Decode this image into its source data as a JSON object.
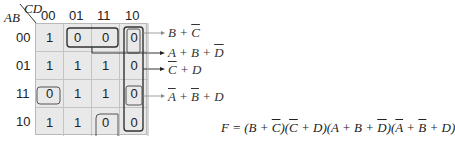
{
  "kmap": {
    "row_var": "AB",
    "col_var": "CD",
    "col_labels": [
      "00",
      "01",
      "11",
      "10"
    ],
    "row_labels": [
      "00",
      "01",
      "11",
      "10"
    ],
    "cells": [
      [
        "1",
        "0",
        "0",
        "0"
      ],
      [
        "1",
        "1",
        "1",
        "0"
      ],
      [
        "0",
        "1",
        "1",
        "0"
      ],
      [
        "1",
        "1",
        "0",
        "0"
      ]
    ]
  },
  "groups": [
    {
      "label_parts": [
        {
          "t": "B + "
        },
        {
          "t": "C",
          "ov": true
        }
      ],
      "text": "B+C̅"
    },
    {
      "label_parts": [
        {
          "t": "A + B + "
        },
        {
          "t": "D",
          "ov": true
        }
      ],
      "text": "A+B+D̅"
    },
    {
      "label_parts": [
        {
          "t": "C",
          "ov": true
        },
        {
          "t": " + D"
        }
      ],
      "text": "C̅+D"
    },
    {
      "label_parts": [
        {
          "t": "A",
          "ov": true
        },
        {
          "t": " + "
        },
        {
          "t": "B",
          "ov": true
        },
        {
          "t": " + D"
        }
      ],
      "text": "A̅+B̅+D"
    }
  ],
  "formula": {
    "text": "F = (B + C̅)(C̅ + D)(A + B + D̅)(A̅ + B̅ + D)",
    "parts": [
      {
        "t": "F = (B + "
      },
      {
        "t": "C",
        "ov": true
      },
      {
        "t": ")("
      },
      {
        "t": "C",
        "ov": true
      },
      {
        "t": " + D)(A + B + "
      },
      {
        "t": "D",
        "ov": true
      },
      {
        "t": ")("
      },
      {
        "t": "A",
        "ov": true
      },
      {
        "t": " + "
      },
      {
        "t": "B",
        "ov": true
      },
      {
        "t": " + D)"
      }
    ]
  }
}
